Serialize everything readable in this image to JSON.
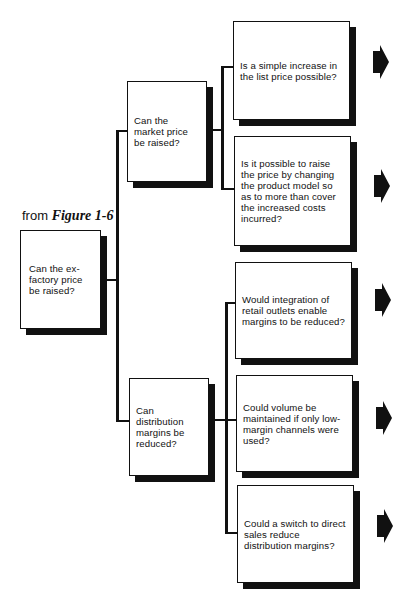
{
  "source_label": {
    "prefix": "from",
    "figure": "Figure 1-6"
  },
  "root": {
    "text": "Can the ex-factory price be raised?"
  },
  "branches": [
    {
      "text": "Can the market price be raised?",
      "children": [
        {
          "text": "Is a simple increase in the list price possible?"
        },
        {
          "text": "Is it possible to raise the price by changing the product model so as to more than cover the increased costs incurred?"
        }
      ]
    },
    {
      "text": "Can distribution margins be reduced?",
      "children": [
        {
          "text": "Would integration of retail outlets enable margins to be reduced?"
        },
        {
          "text": "Could volume be maintained if only low-margin channels were used?"
        },
        {
          "text": "Could a switch to direct sales reduce distribution margins?"
        }
      ]
    }
  ],
  "arrow_icon": "right-pointing-block-arrow",
  "colors": {
    "ink": "#111111",
    "paper": "#ffffff"
  }
}
